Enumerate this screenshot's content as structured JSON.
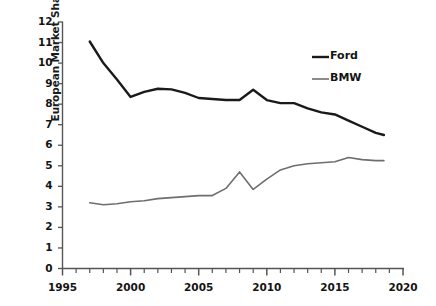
{
  "chart_data": {
    "type": "line",
    "title": "",
    "xlabel": "",
    "ylabel": "European Market Share (%)",
    "xlim": [
      1995,
      2020
    ],
    "ylim": [
      0,
      12
    ],
    "x_ticks_major": [
      1995,
      2000,
      2005,
      2010,
      2015,
      2020
    ],
    "x_tick_labels": [
      "1995",
      "2000",
      "2005",
      "2010",
      "2015",
      "2020"
    ],
    "x_tick_interval_minor": 1,
    "y_ticks": [
      0,
      1,
      2,
      3,
      4,
      5,
      6,
      7,
      8,
      9,
      10,
      11,
      12
    ],
    "y_tick_labels": [
      "0",
      "1",
      "2",
      "3",
      "4",
      "5",
      "6",
      "7",
      "8",
      "9",
      "10",
      "11",
      "12"
    ],
    "grid": false,
    "legend_position": "upper right",
    "series": [
      {
        "name": "Ford",
        "color": "#1a1a1a",
        "line_width": 2.4,
        "x": [
          1997,
          1998,
          1999,
          2000,
          2001,
          2002,
          2003,
          2004,
          2005,
          2006,
          2007,
          2008,
          2009,
          2010,
          2011,
          2012,
          2013,
          2014,
          2015,
          2016,
          2017,
          2018,
          2018.6
        ],
        "values": [
          11.05,
          10.0,
          9.2,
          8.35,
          8.6,
          8.75,
          8.72,
          8.55,
          8.3,
          8.25,
          8.2,
          8.2,
          8.7,
          8.2,
          8.05,
          8.05,
          7.8,
          7.6,
          7.5,
          7.2,
          6.9,
          6.6,
          6.5
        ]
      },
      {
        "name": "BMW",
        "color": "#6e6e6e",
        "line_width": 1.6,
        "x": [
          1997,
          1998,
          1999,
          2000,
          2001,
          2002,
          2003,
          2004,
          2005,
          2006,
          2007,
          2008,
          2009,
          2010,
          2011,
          2012,
          2013,
          2014,
          2015,
          2016,
          2017,
          2018,
          2018.6
        ],
        "values": [
          3.2,
          3.1,
          3.15,
          3.25,
          3.3,
          3.4,
          3.45,
          3.5,
          3.55,
          3.55,
          3.9,
          4.7,
          3.85,
          4.35,
          4.8,
          5.0,
          5.1,
          5.15,
          5.2,
          5.4,
          5.3,
          5.25,
          5.25
        ]
      }
    ]
  },
  "legend": {
    "entries": [
      {
        "label": "Ford",
        "color": "#1a1a1a"
      },
      {
        "label": "BMW",
        "color": "#6e6e6e"
      }
    ]
  },
  "axes": {
    "axis_color": "#555555",
    "tick_color": "#555555"
  }
}
